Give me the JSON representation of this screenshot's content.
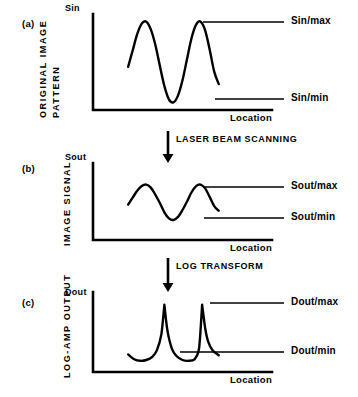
{
  "figure": {
    "background": "#ffffff",
    "ink": "#000000",
    "panels": [
      {
        "tag": "(a)",
        "y_axis_title": "Sin",
        "y_axis_label_lines": [
          "ORIGINAL IMAGE",
          "PATTERN"
        ],
        "x_axis_title": "Location",
        "max_level_label": "Sin/max",
        "min_level_label": "Sin/min"
      },
      {
        "tag": "(b)",
        "y_axis_title": "Sout",
        "y_axis_label_lines": [
          "IMAGE SIGNAL"
        ],
        "x_axis_title": "Location",
        "max_level_label": "Sout/max",
        "min_level_label": "Sout/min"
      },
      {
        "tag": "(c)",
        "y_axis_title": "Dout",
        "y_axis_label_lines": [
          "LOG-AMP OUTPUT"
        ],
        "x_axis_title": "Location",
        "max_level_label": "Dout/max",
        "min_level_label": "Dout/min"
      }
    ],
    "transitions": [
      {
        "label": "LASER BEAM SCANNING"
      },
      {
        "label": "LOG TRANSFORM"
      }
    ]
  },
  "chart_data": [
    {
      "type": "line",
      "title": "Original image pattern",
      "xlabel": "Location",
      "ylabel": "ORIGINAL IMAGE PATTERN",
      "y_axis_symbol": "Sin",
      "grid": false,
      "legend": "none",
      "xlim": [
        0,
        100
      ],
      "ylim": [
        0,
        100
      ],
      "annotations": [
        {
          "text": "Sin/max",
          "y": 92,
          "type": "level-line"
        },
        {
          "text": "Sin/min",
          "y": 8,
          "type": "level-line"
        }
      ],
      "series": [
        {
          "name": "Sin",
          "shape": "sinusoid",
          "amplitude": 42,
          "offset": 50,
          "cycles": 2.0,
          "phase_deg": 200,
          "x_start": 14,
          "x_end": 74,
          "x": [
            14,
            17,
            20,
            23,
            26,
            29,
            32,
            35,
            38,
            41,
            44,
            47,
            50,
            53,
            56,
            59,
            62,
            65,
            68,
            71,
            74
          ],
          "y": [
            45,
            62,
            79,
            90,
            92,
            84,
            68,
            46,
            25,
            11,
            8,
            15,
            31,
            53,
            75,
            89,
            92,
            83,
            63,
            40,
            27
          ]
        }
      ]
    },
    {
      "type": "line",
      "title": "Image signal after laser beam scanning",
      "xlabel": "Location",
      "ylabel": "IMAGE SIGNAL",
      "y_axis_symbol": "Sout",
      "grid": false,
      "legend": "none",
      "xlim": [
        0,
        100
      ],
      "ylim": [
        0,
        100
      ],
      "annotations": [
        {
          "text": "Sout/max",
          "y": 72,
          "type": "level-line"
        },
        {
          "text": "Sout/min",
          "y": 26,
          "type": "level-line"
        }
      ],
      "series": [
        {
          "name": "Sout",
          "shape": "sinusoid",
          "amplitude": 23,
          "offset": 49,
          "cycles": 2.0,
          "phase_deg": 200,
          "x_start": 14,
          "x_end": 74,
          "x": [
            14,
            17,
            20,
            23,
            26,
            29,
            32,
            35,
            38,
            41,
            44,
            47,
            50,
            53,
            56,
            59,
            62,
            65,
            68,
            71,
            74
          ],
          "y": [
            46,
            55,
            64,
            70,
            72,
            68,
            59,
            48,
            36,
            28,
            26,
            30,
            39,
            50,
            62,
            70,
            72,
            67,
            56,
            44,
            38
          ]
        }
      ]
    },
    {
      "type": "line",
      "title": "Log-amp output after log transform",
      "xlabel": "Location",
      "ylabel": "LOG-AMP OUTPUT",
      "y_axis_symbol": "Dout",
      "grid": false,
      "legend": "none",
      "xlim": [
        0,
        100
      ],
      "ylim": [
        0,
        100
      ],
      "annotations": [
        {
          "text": "Dout/max",
          "y": 84,
          "type": "level-line"
        },
        {
          "text": "Dout/min",
          "y": 13,
          "type": "level-line"
        }
      ],
      "series": [
        {
          "name": "Dout",
          "shape": "two-cusp-peaks",
          "peak_positions": [
            38,
            63
          ],
          "peak_value": 84,
          "baseline": 14,
          "x_start": 14,
          "x_end": 74,
          "x": [
            14,
            18,
            22,
            26,
            30,
            33,
            36,
            38,
            40,
            43,
            46,
            50,
            54,
            58,
            61,
            63,
            65,
            67,
            70,
            74
          ],
          "y": [
            22,
            16,
            14,
            15,
            19,
            27,
            47,
            84,
            52,
            29,
            20,
            15,
            14,
            16,
            30,
            84,
            55,
            38,
            27,
            21
          ]
        }
      ]
    }
  ]
}
